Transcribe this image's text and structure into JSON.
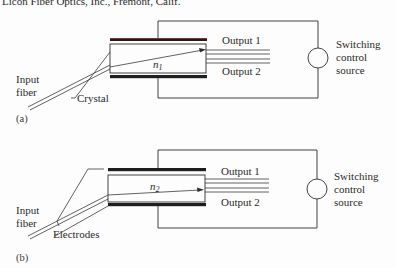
{
  "header_fragment": "Licon Fiber Optics, Inc., Fremont, Calif.",
  "panels": [
    {
      "id": "a",
      "caption": "(a)",
      "input_label_line1": "Input",
      "input_label_line2": "fiber",
      "pointer_label": "Crystal",
      "index_symbol": "n",
      "index_subscript": "1",
      "output1": "Output 1",
      "output2": "Output 2",
      "source_line1": "Switching",
      "source_line2": "control",
      "source_line3": "source",
      "beam_target": "Output 1"
    },
    {
      "id": "b",
      "caption": "(b)",
      "input_label_line1": "Input",
      "input_label_line2": "fiber",
      "pointer_label": "Electrodes",
      "index_symbol": "n",
      "index_subscript": "2",
      "output1": "Output 1",
      "output2": "Output 2",
      "source_line1": "Switching",
      "source_line2": "control",
      "source_line3": "source",
      "beam_target": "Output 2"
    }
  ],
  "colors": {
    "line": "#2e2e2e",
    "electrode": "#1e1e1e",
    "electrode_tint": "#b03030",
    "background": "#fdfdfd"
  }
}
